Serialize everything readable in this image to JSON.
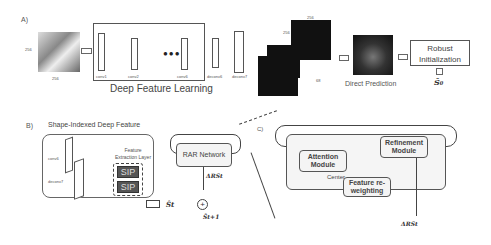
{
  "panelA": {
    "label": "A)",
    "input_size_h": "256",
    "input_size_w": "256",
    "deep_feature_learning": "Deep Feature Learning",
    "layers": [
      "conv1",
      "conv2",
      "conv6",
      "deconv6",
      "deconv7"
    ],
    "deconv6_dims": [
      "96",
      "128",
      "256"
    ],
    "deconv7_dims": [
      "96",
      "256",
      "256"
    ],
    "heatmap_dims": [
      "256",
      "256",
      "68"
    ],
    "direct_prediction": "Direct Prediction",
    "robust_initialization": "Robust Initialization",
    "s0": "Ŝ₀"
  },
  "panelB": {
    "label": "B)",
    "title": "Shape-Indexed Deep Feature",
    "layers": [
      "conv6",
      "deconv7"
    ],
    "feature_extraction_layer": "Feature Extraction Layer",
    "sip_labels": [
      "SIP",
      "SIP"
    ],
    "rar_network": "RAR Network",
    "delta": "ΔRSt",
    "st": "Ŝt",
    "st1": "Ŝt+1",
    "plus": "+"
  },
  "panelC": {
    "label": "C)",
    "attention_module": "Attention Module",
    "refinement_module": "Refinement Module",
    "feature_reweighting": "Feature re-weighting",
    "center": "Center",
    "delta": "ΔRSt"
  }
}
